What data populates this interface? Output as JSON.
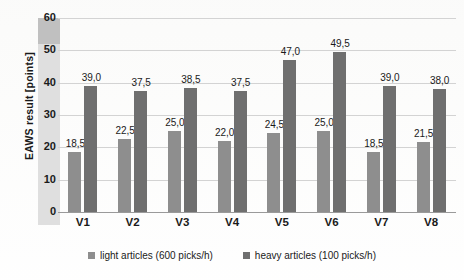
{
  "chart_data": {
    "type": "bar",
    "title": "",
    "subtitle": "",
    "xlabel": "",
    "ylabel": "EAWS result  [points]",
    "categories": [
      "V1",
      "V2",
      "V3",
      "V4",
      "V5",
      "V6",
      "V7",
      "V8"
    ],
    "ylim": [
      0,
      60
    ],
    "ytick_labels": [
      "0",
      "10",
      "20",
      "30",
      "40",
      "50",
      "60"
    ],
    "ytick_values": [
      0,
      10,
      20,
      30,
      40,
      50,
      60
    ],
    "grid": true,
    "legend_position": "bottom-center",
    "decimal_separator": ",",
    "series": [
      {
        "name": "light articles (600 picks/h)",
        "color": "#8e8e8e",
        "values": [
          18.5,
          22.5,
          25.0,
          22.0,
          24.5,
          25.0,
          18.5,
          21.5
        ],
        "data_labels": [
          "18,5",
          "22,5",
          "25,0",
          "22,0",
          "24,5",
          "25,0",
          "18,5",
          "21,5"
        ]
      },
      {
        "name": "heavy articles (100 picks/h)",
        "color": "#6f6f6f",
        "values": [
          39.0,
          37.5,
          38.5,
          37.5,
          47.0,
          49.5,
          39.0,
          38.0
        ],
        "data_labels": [
          "39,0",
          "37,5",
          "38,5",
          "37,5",
          "47,0",
          "49,5",
          "39,0",
          "38,0"
        ]
      }
    ]
  },
  "legend": {
    "items": [
      {
        "label": "light articles (600 picks/h)",
        "color": "#8e8e8e"
      },
      {
        "label": "heavy articles (100 picks/h)",
        "color": "#6f6f6f"
      }
    ]
  }
}
